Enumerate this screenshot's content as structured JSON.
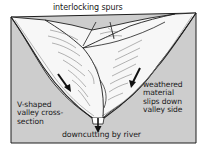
{
  "diagram": {
    "colors": {
      "background": "#ffffff",
      "rock_fill": "#cdcdcd",
      "valley_fill": "#f7f7f7",
      "outline": "#1e1e1e",
      "arrow": "#111111"
    },
    "labels": {
      "interlocking_spurs": "interlocking spurs",
      "v_shaped": "V-shaped\nvalley cross-\nsection",
      "weathered": "weathered\nmaterial\nslips down\nvalley side",
      "downcutting": "downcutting by river"
    },
    "arrows": [
      {
        "name": "slip-arrow-left",
        "meaning": "weathered material slipping down left valley side"
      },
      {
        "name": "slip-arrow-right",
        "meaning": "weathered material slipping down right valley side"
      },
      {
        "name": "downcutting-arrow",
        "meaning": "river erodes vertically downward"
      }
    ]
  }
}
